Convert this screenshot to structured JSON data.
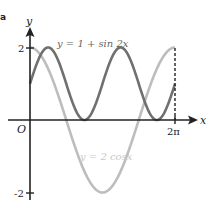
{
  "part_label": "a",
  "chart_data": {
    "type": "line",
    "title": "",
    "xlabel": "x",
    "ylabel": "y",
    "origin_label": "O",
    "xlim": [
      0,
      6.2832
    ],
    "ylim": [
      -2,
      2
    ],
    "x_ticks": [
      {
        "value": 6.2832,
        "label": "2π"
      }
    ],
    "y_ticks": [
      {
        "value": 2,
        "label": "2"
      },
      {
        "value": -2,
        "label": "-2"
      }
    ],
    "grid": false,
    "series": [
      {
        "name": "y = 1 + sin 2x",
        "expr": "1+sin(2x)",
        "color": "#707070",
        "points": [
          [
            0,
            1
          ],
          [
            0.785,
            2
          ],
          [
            1.571,
            1
          ],
          [
            2.356,
            0
          ],
          [
            3.142,
            1
          ],
          [
            3.927,
            2
          ],
          [
            4.712,
            1
          ],
          [
            5.498,
            0
          ],
          [
            6.283,
            1
          ]
        ]
      },
      {
        "name": "y = 2 cosx",
        "expr": "2cos(x)",
        "color": "#bdbdbd",
        "points": [
          [
            0,
            2
          ],
          [
            1.571,
            0
          ],
          [
            3.142,
            -2
          ],
          [
            4.712,
            0
          ],
          [
            6.283,
            2
          ]
        ]
      }
    ],
    "annotations": [
      {
        "type": "dashed-vertical",
        "x": 6.2832,
        "from_y": 0,
        "to_y": 2
      }
    ]
  }
}
